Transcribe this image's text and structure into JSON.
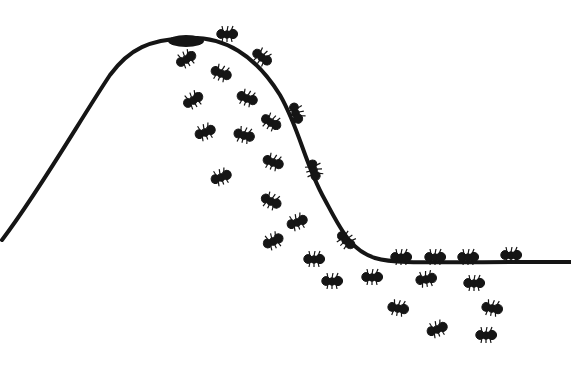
{
  "illustration": {
    "title": "Ants on a bell-shaped curve",
    "background": "#ffffff",
    "ink": "#151515",
    "curve": {
      "path": "M2,240 C40,190 80,120 110,75 C130,48 150,40 185,38 C225,36 255,55 280,95 C300,130 305,165 325,200 C340,228 350,250 375,258 C395,264 420,262 571,262",
      "stroke_width": 4
    },
    "peak_blob": {
      "cx": 186,
      "cy": 41,
      "rx": 18,
      "ry": 6
    },
    "ants_on_curve": [
      {
        "x": 227,
        "y": 34,
        "angle": 0
      },
      {
        "x": 262,
        "y": 57,
        "angle": 35
      },
      {
        "x": 296,
        "y": 113,
        "angle": 70
      },
      {
        "x": 314,
        "y": 170,
        "angle": 75
      },
      {
        "x": 346,
        "y": 240,
        "angle": 45
      },
      {
        "x": 401,
        "y": 257,
        "angle": 0
      },
      {
        "x": 435,
        "y": 257,
        "angle": 0
      },
      {
        "x": 468,
        "y": 257,
        "angle": 0
      },
      {
        "x": 511,
        "y": 255,
        "angle": 0
      }
    ],
    "falling_ants": [
      {
        "x": 186,
        "y": 59,
        "angle": -30
      },
      {
        "x": 221,
        "y": 73,
        "angle": 20
      },
      {
        "x": 193,
        "y": 100,
        "angle": -30
      },
      {
        "x": 247,
        "y": 98,
        "angle": 20
      },
      {
        "x": 205,
        "y": 132,
        "angle": -20
      },
      {
        "x": 244,
        "y": 135,
        "angle": 15
      },
      {
        "x": 271,
        "y": 122,
        "angle": 30
      },
      {
        "x": 221,
        "y": 177,
        "angle": -20
      },
      {
        "x": 273,
        "y": 162,
        "angle": 20
      },
      {
        "x": 271,
        "y": 201,
        "angle": 25
      },
      {
        "x": 297,
        "y": 222,
        "angle": -20
      },
      {
        "x": 273,
        "y": 241,
        "angle": -25
      },
      {
        "x": 314,
        "y": 259,
        "angle": 0
      },
      {
        "x": 332,
        "y": 281,
        "angle": 0
      },
      {
        "x": 372,
        "y": 277,
        "angle": 0
      },
      {
        "x": 426,
        "y": 279,
        "angle": -10
      },
      {
        "x": 474,
        "y": 283,
        "angle": 0
      },
      {
        "x": 398,
        "y": 308,
        "angle": 10
      },
      {
        "x": 492,
        "y": 308,
        "angle": 10
      },
      {
        "x": 437,
        "y": 329,
        "angle": -20
      },
      {
        "x": 486,
        "y": 335,
        "angle": 0
      }
    ]
  }
}
